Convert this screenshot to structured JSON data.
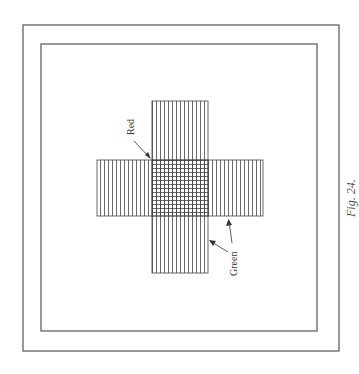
{
  "figure": {
    "caption": "Fig. 24.",
    "labels": {
      "red": "Red",
      "green": "Green"
    },
    "colors": {
      "line": "#444444",
      "frame": "#555555",
      "background": "#ffffff"
    },
    "frames": {
      "outer": {
        "x": 23,
        "y": 25,
        "w": 316,
        "h": 326
      },
      "inner": {
        "x": 41,
        "y": 44,
        "w": 276,
        "h": 287
      }
    },
    "cross": {
      "vertical_arm": {
        "x": 152,
        "y": 101,
        "w": 56,
        "h": 172,
        "hatch": "vertical"
      },
      "horizontal_arm": {
        "x": 97,
        "y": 160,
        "w": 166,
        "h": 56,
        "hatch": "vertical"
      },
      "center_overlap": {
        "x": 152,
        "y": 160,
        "w": 56,
        "h": 56,
        "hatch": "grid"
      },
      "line_spacing": 4
    }
  }
}
